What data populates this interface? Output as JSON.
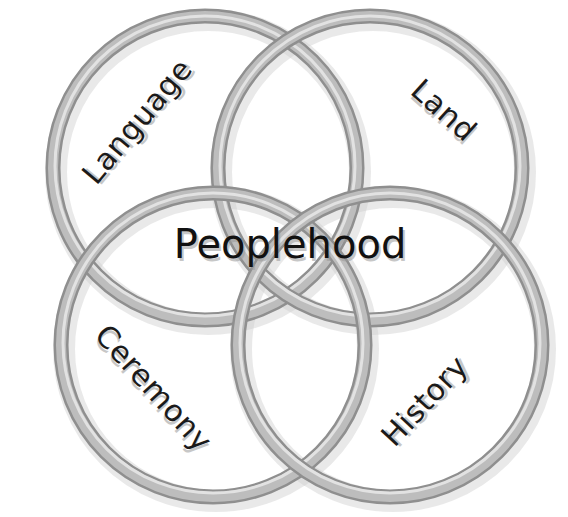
{
  "diagram": {
    "type": "venn",
    "center_label": "Peoplehood",
    "circles": [
      {
        "id": "language",
        "label": "Language",
        "cx": 205,
        "cy": 168,
        "r": 152,
        "position": "top-left"
      },
      {
        "id": "land",
        "label": "Land",
        "cx": 370,
        "cy": 168,
        "r": 152,
        "position": "top-right"
      },
      {
        "id": "ceremony",
        "label": "Ceremony",
        "cx": 213,
        "cy": 345,
        "r": 152,
        "position": "bottom-left"
      },
      {
        "id": "history",
        "label": "History",
        "cx": 390,
        "cy": 345,
        "r": 152,
        "position": "bottom-right"
      }
    ],
    "colors": {
      "ring_dark": "#8f8f8f",
      "ring_mid": "#bdbdbd",
      "ring_highlight": "#e2e2e2",
      "text": "#1a1a1a",
      "background": "#ffffff"
    }
  }
}
